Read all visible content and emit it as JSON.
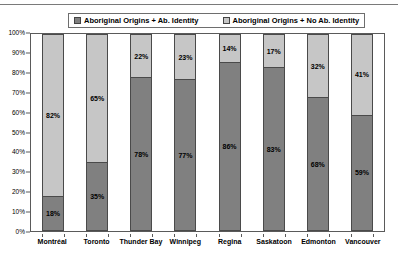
{
  "legend": {
    "entries": [
      {
        "label": "Aboriginal Origins + Ab. Identity",
        "swatch": "dark",
        "color": "#808080"
      },
      {
        "label": "Aboriginal Origins + No Ab. Identity",
        "swatch": "light",
        "color": "#C6C6C6"
      }
    ]
  },
  "chart_data": {
    "type": "bar",
    "stacked": true,
    "normalized_percent": true,
    "title": "",
    "subtitle": "",
    "xlabel": "",
    "ylabel": "",
    "ylim": [
      0,
      100
    ],
    "ytick_labels": [
      "0%",
      "10%",
      "20%",
      "30%",
      "40%",
      "50%",
      "60%",
      "70%",
      "80%",
      "90%",
      "100%"
    ],
    "ytick_values": [
      0,
      10,
      20,
      30,
      40,
      50,
      60,
      70,
      80,
      90,
      100
    ],
    "grid": false,
    "legend_position": "top",
    "categories": [
      "Montréal",
      "Toronto",
      "Thunder Bay",
      "Winnipeg",
      "Regina",
      "Saskatoon",
      "Edmonton",
      "Vancouver"
    ],
    "series": [
      {
        "name": "Aboriginal Origins + Ab. Identity",
        "color": "#808080",
        "values": [
          18,
          35,
          78,
          77,
          86,
          83,
          68,
          59
        ],
        "labels": [
          "18%",
          "35%",
          "78%",
          "77%",
          "86%",
          "83%",
          "68%",
          "59%"
        ]
      },
      {
        "name": "Aboriginal Origins + No Ab. Identity",
        "color": "#C6C6C6",
        "values": [
          82,
          65,
          22,
          23,
          14,
          17,
          32,
          41
        ],
        "labels": [
          "82%",
          "65%",
          "22%",
          "23%",
          "14%",
          "17%",
          "32%",
          "41%"
        ]
      }
    ]
  }
}
